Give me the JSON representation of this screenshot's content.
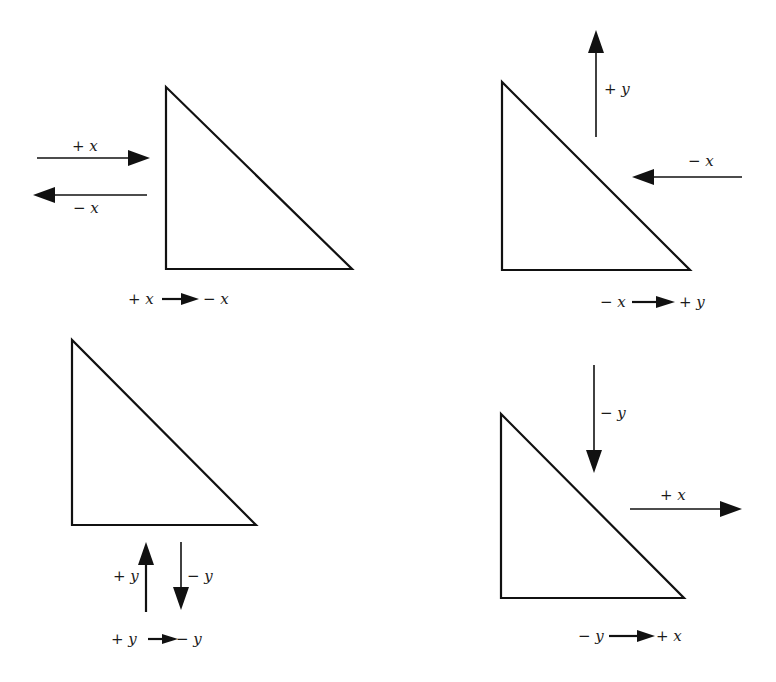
{
  "panels": [
    {
      "id": "top-left",
      "arrows": [
        {
          "label": "+ x",
          "direction": "right"
        },
        {
          "label": "− x",
          "direction": "left"
        }
      ],
      "caption": {
        "from": "+ x",
        "to": "− x"
      }
    },
    {
      "id": "top-right",
      "arrows": [
        {
          "label": "+ y",
          "direction": "up"
        },
        {
          "label": "− x",
          "direction": "left"
        }
      ],
      "caption": {
        "from": "− x",
        "to": "+ y"
      }
    },
    {
      "id": "bottom-left",
      "arrows": [
        {
          "label": "+ y",
          "direction": "up"
        },
        {
          "label": "− y",
          "direction": "down"
        }
      ],
      "caption": {
        "from": "+ y",
        "to": "− y"
      }
    },
    {
      "id": "bottom-right",
      "arrows": [
        {
          "label": "− y",
          "direction": "down"
        },
        {
          "label": "+ x",
          "direction": "right"
        }
      ],
      "caption": {
        "from": "− y",
        "to": "+ x"
      }
    }
  ],
  "colors": {
    "ink": "#111111",
    "background": "#ffffff"
  }
}
